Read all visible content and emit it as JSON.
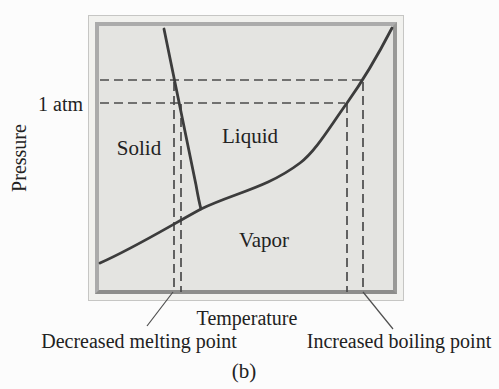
{
  "figure": {
    "caption": "(b)",
    "y_axis_label": "Pressure",
    "x_axis_label": "Temperature",
    "pressure_reference": "1 atm",
    "regions": {
      "solid": "Solid",
      "liquid": "Liquid",
      "vapor": "Vapor"
    },
    "annotations": {
      "decreased_melting": "Decreased melting point",
      "increased_boiling": "Increased boiling point"
    }
  },
  "colors": {
    "page_background": "#fcfcfc",
    "panel_fill": "#e4e4e1",
    "frame_band": "#f1f1ee",
    "frame_inner_border": "#9a9a98",
    "frame_outer_border": "#c6c6c4",
    "curve_stroke": "#3c3c3c",
    "dashed_stroke": "#4b4b4b",
    "text": "#222222"
  },
  "paths": {
    "vaporization_curve": "M 100 263 C 134 248 168 227 201 209 C 234 193 267 188 300 163 C 316 151 331 125 347 103 C 362 82 377 57 392 28",
    "fusion_curve": "M 164 29 L 196 185 Q 199 202 201 209",
    "h_high_pressure": "M 100 80 H 362",
    "h_one_atm": "M 100 103 H 345",
    "v_melting_high_pressure": "M 174 82 V 292",
    "v_melting_one_atm": "M 181 104 V 292",
    "v_boiling_one_atm": "M 347 104 V 292",
    "v_boiling_high_pressure": "M 363 82 V 292",
    "leader_melting": "M 173 292 L 147 326",
    "leader_boiling": "M 363 292 L 393 329"
  }
}
